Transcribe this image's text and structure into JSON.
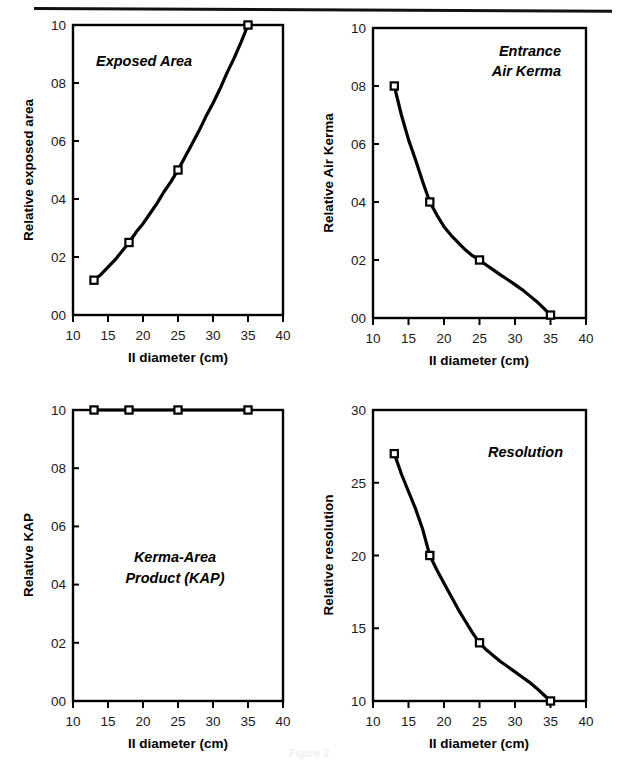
{
  "figure": {
    "caption": "Figure 2",
    "panel_count": 4,
    "line_color": "#000000",
    "frame_color": "#000000",
    "background": "#ffffff"
  },
  "common": {
    "xlabel": "II diameter (cm)",
    "xlim": [
      10,
      40
    ],
    "xticks": [
      10,
      15,
      20,
      25,
      30,
      35,
      40
    ],
    "xticklabels": [
      "10",
      "15",
      "20",
      "25",
      "30",
      "35",
      "40"
    ]
  },
  "chart_data": [
    {
      "type": "line",
      "title": "Exposed Area",
      "title_lines": [
        "Exposed Area"
      ],
      "xlabel": "II diameter (cm)",
      "ylabel": "Relative exposed area",
      "xlim": [
        10,
        40
      ],
      "ylim": [
        0.0,
        1.0
      ],
      "xticks": [
        10,
        15,
        20,
        25,
        30,
        35,
        40
      ],
      "xticklabels": [
        "10",
        "15",
        "20",
        "25",
        "30",
        "35",
        "40"
      ],
      "yticks": [
        0.0,
        0.2,
        0.4,
        0.6,
        0.8,
        1.0
      ],
      "yticklabels": [
        "00",
        "02",
        "04",
        "06",
        "08",
        "10"
      ],
      "grid": false,
      "legend": "none",
      "marker": "open-square",
      "markers_x": [
        13,
        18,
        25,
        35
      ],
      "markers_y": [
        0.12,
        0.25,
        0.5,
        1.0
      ],
      "x": [
        13,
        14,
        15,
        16,
        17,
        18,
        19,
        20,
        21,
        22,
        23,
        24,
        25,
        26,
        27,
        28,
        29,
        30,
        31,
        32,
        33,
        34,
        35
      ],
      "y": [
        0.12,
        0.14,
        0.165,
        0.19,
        0.22,
        0.25,
        0.285,
        0.315,
        0.35,
        0.385,
        0.425,
        0.46,
        0.5,
        0.545,
        0.59,
        0.635,
        0.685,
        0.73,
        0.78,
        0.835,
        0.885,
        0.94,
        1.0
      ]
    },
    {
      "type": "line",
      "title": "Entrance Air Kerma",
      "title_lines": [
        "Entrance",
        "Air Kerma"
      ],
      "xlabel": "II diameter (cm)",
      "ylabel": "Relative Air Kerma",
      "xlim": [
        10,
        40
      ],
      "ylim": [
        0.0,
        1.0
      ],
      "xticks": [
        10,
        15,
        20,
        25,
        30,
        35,
        40
      ],
      "xticklabels": [
        "10",
        "15",
        "20",
        "25",
        "30",
        "35",
        "40"
      ],
      "yticks": [
        0.0,
        0.2,
        0.4,
        0.6,
        0.8,
        1.0
      ],
      "yticklabels": [
        "00",
        "02",
        "04",
        "06",
        "08",
        "10"
      ],
      "grid": false,
      "legend": "none",
      "marker": "open-square",
      "markers_x": [
        13,
        18,
        25,
        35
      ],
      "markers_y": [
        0.8,
        0.4,
        0.2,
        0.01
      ],
      "x": [
        13,
        14,
        15,
        16,
        17,
        18,
        19,
        20,
        21,
        22,
        23,
        24,
        25,
        26,
        27,
        28,
        29,
        30,
        31,
        32,
        33,
        34,
        35
      ],
      "y": [
        0.8,
        0.7,
        0.615,
        0.545,
        0.47,
        0.4,
        0.355,
        0.315,
        0.285,
        0.26,
        0.235,
        0.215,
        0.2,
        0.182,
        0.165,
        0.148,
        0.132,
        0.115,
        0.098,
        0.078,
        0.058,
        0.035,
        0.01
      ]
    },
    {
      "type": "line",
      "title": "Kerma-Area Product (KAP)",
      "title_lines": [
        "Kerma-Area",
        "Product (KAP)"
      ],
      "xlabel": "II diameter (cm)",
      "ylabel": "Relative KAP",
      "xlim": [
        10,
        40
      ],
      "ylim": [
        0.0,
        1.0
      ],
      "xticks": [
        10,
        15,
        20,
        25,
        30,
        35,
        40
      ],
      "xticklabels": [
        "10",
        "15",
        "20",
        "25",
        "30",
        "35",
        "40"
      ],
      "yticks": [
        0.0,
        0.2,
        0.4,
        0.6,
        0.8,
        1.0
      ],
      "yticklabels": [
        "00",
        "02",
        "04",
        "06",
        "08",
        "10"
      ],
      "grid": false,
      "legend": "none",
      "marker": "open-square",
      "markers_x": [
        13,
        18,
        25,
        35
      ],
      "markers_y": [
        1.0,
        1.0,
        1.0,
        1.0
      ],
      "x": [
        13,
        18,
        25,
        35
      ],
      "y": [
        1.0,
        1.0,
        1.0,
        1.0
      ]
    },
    {
      "type": "line",
      "title": "Resolution",
      "title_lines": [
        "Resolution"
      ],
      "xlabel": "II diameter (cm)",
      "ylabel": "Relative resolution",
      "xlim": [
        10,
        40
      ],
      "ylim": [
        10,
        30
      ],
      "xticks": [
        10,
        15,
        20,
        25,
        30,
        35,
        40
      ],
      "xticklabels": [
        "10",
        "15",
        "20",
        "25",
        "30",
        "35",
        "40"
      ],
      "yticks": [
        10,
        15,
        20,
        25,
        30
      ],
      "yticklabels": [
        "10",
        "15",
        "20",
        "25",
        "30"
      ],
      "grid": false,
      "legend": "none",
      "marker": "open-square",
      "markers_x": [
        13,
        18,
        25,
        35
      ],
      "markers_y": [
        27.0,
        20.0,
        14.0,
        10.0
      ],
      "x": [
        13,
        14,
        15,
        16,
        17,
        18,
        19,
        20,
        21,
        22,
        23,
        24,
        25,
        26,
        27,
        28,
        29,
        30,
        31,
        32,
        33,
        34,
        35
      ],
      "y": [
        27.0,
        25.6,
        24.4,
        23.2,
        21.8,
        20.0,
        19.0,
        18.1,
        17.2,
        16.3,
        15.5,
        14.7,
        14.0,
        13.5,
        13.1,
        12.7,
        12.35,
        12.0,
        11.65,
        11.3,
        10.9,
        10.45,
        10.0
      ]
    }
  ]
}
